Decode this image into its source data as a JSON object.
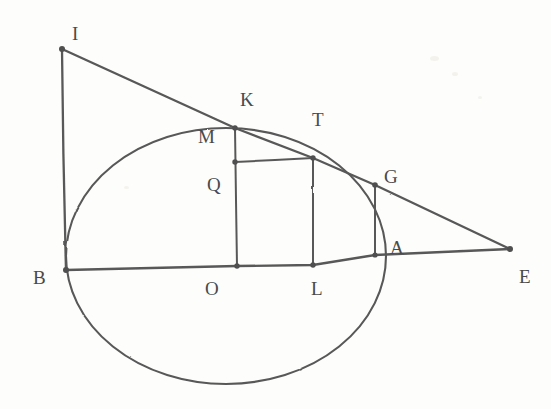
{
  "figure": {
    "background_color": "#fdfdfb",
    "stroke_color": "#585858",
    "label_color": "#4a4a4a",
    "width": 551,
    "height": 409
  },
  "labels": {
    "I": "I",
    "K": "K",
    "M": "M",
    "T": "T",
    "Q": "Q",
    "G": "G",
    "A": "A",
    "B": "B",
    "O": "O",
    "L": "L",
    "E": "E"
  },
  "label_positions": {
    "I": {
      "x": 72,
      "y": 24
    },
    "K": {
      "x": 240,
      "y": 90
    },
    "M": {
      "x": 198,
      "y": 127
    },
    "T": {
      "x": 312,
      "y": 110
    },
    "Q": {
      "x": 207,
      "y": 175
    },
    "G": {
      "x": 384,
      "y": 167
    },
    "A": {
      "x": 390,
      "y": 238
    },
    "B": {
      "x": 33,
      "y": 268
    },
    "O": {
      "x": 205,
      "y": 279
    },
    "L": {
      "x": 311,
      "y": 279
    },
    "E": {
      "x": 519,
      "y": 267
    }
  },
  "points": {
    "I": {
      "x": 62,
      "y": 49
    },
    "K": {
      "x": 235,
      "y": 128
    },
    "M": {
      "x": 235,
      "y": 128
    },
    "Q": {
      "x": 235,
      "y": 162
    },
    "T": {
      "x": 313,
      "y": 158
    },
    "G": {
      "x": 375,
      "y": 185
    },
    "A": {
      "x": 375,
      "y": 255
    },
    "B": {
      "x": 66,
      "y": 270
    },
    "O": {
      "x": 237,
      "y": 266
    },
    "L": {
      "x": 313,
      "y": 265
    },
    "E": {
      "x": 510,
      "y": 249
    }
  },
  "circle": {
    "center_x": 226,
    "center_y": 256,
    "radius_x": 160,
    "radius_y": 128,
    "name": "main-circle"
  },
  "segments": [
    {
      "name": "segment-I-B",
      "from": "I",
      "to": "B"
    },
    {
      "name": "segment-I-E",
      "from": "I",
      "to": "E"
    },
    {
      "name": "segment-B-E",
      "from": "B",
      "to": "E"
    },
    {
      "name": "segment-M-O",
      "from": "M",
      "to": "O"
    },
    {
      "name": "segment-T-L",
      "from": "T",
      "to": "L"
    },
    {
      "name": "segment-G-A",
      "from": "G",
      "to": "A"
    },
    {
      "name": "segment-Q-T",
      "from": "Q",
      "to": "T"
    }
  ],
  "specks": [
    {
      "x": 430,
      "y": 56,
      "w": 9,
      "h": 5
    },
    {
      "x": 452,
      "y": 72,
      "w": 6,
      "h": 4
    },
    {
      "x": 124,
      "y": 186,
      "w": 5,
      "h": 3
    },
    {
      "x": 478,
      "y": 96,
      "w": 4,
      "h": 3
    }
  ]
}
